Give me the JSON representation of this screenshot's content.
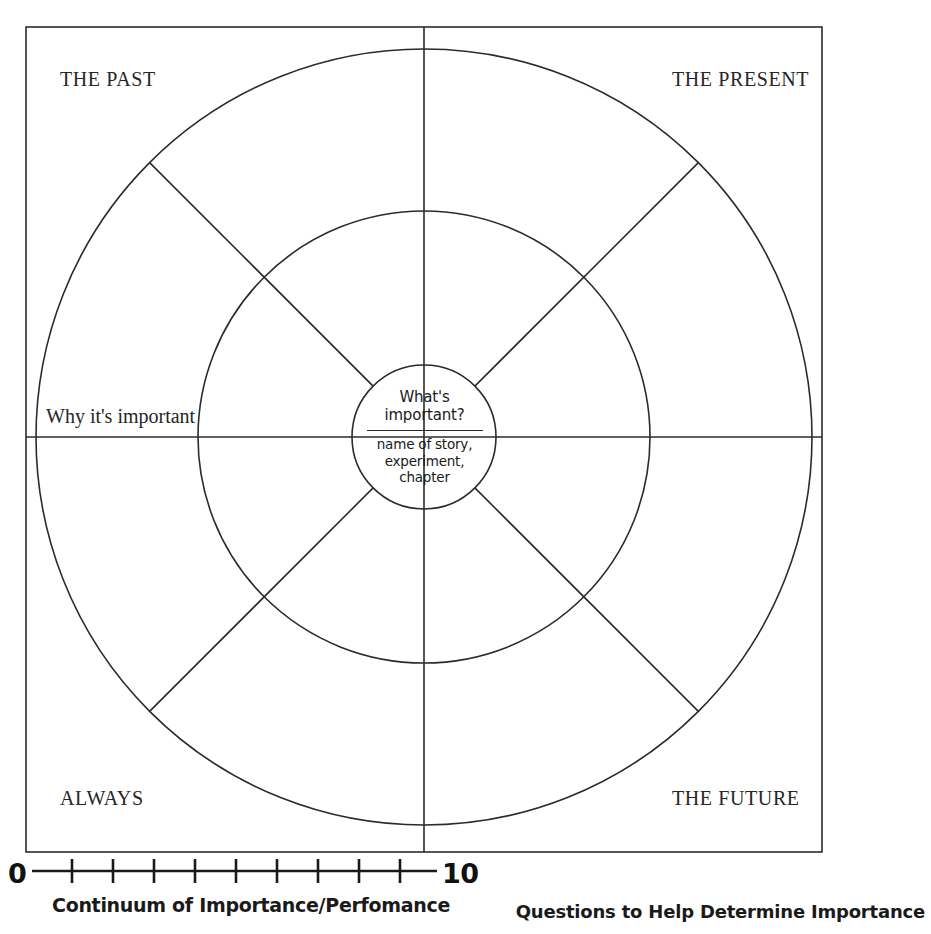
{
  "diagram": {
    "title_caption": "Questions to Help Determine Importance",
    "quadrants": [
      {
        "id": "past",
        "label": "THE PAST"
      },
      {
        "id": "present",
        "label": "THE PRESENT"
      },
      {
        "id": "always",
        "label": "ALWAYS"
      },
      {
        "id": "future",
        "label": "THE FUTURE"
      }
    ],
    "axis_labels": {
      "left": "Why it's important"
    },
    "center": {
      "prompt": "What's\nimportant?",
      "prompt_line1": "What's",
      "prompt_line2": "important?",
      "subject": "name of story,\nexperiment,\nchapter",
      "subject_line1": "name of story,",
      "subject_line2": "experiment,",
      "subject_line3": "chapter"
    },
    "scale": {
      "min_label": "0",
      "max_label": "10",
      "caption": "Continuum of Importance/Perfomance",
      "tick_count": 9
    },
    "colors": {
      "stroke": "#2b2b2b",
      "text": "#1a1a1a",
      "background": "#ffffff"
    },
    "geometry": {
      "center_x": 424,
      "center_y": 437,
      "outer_radius": 388,
      "middle_radius": 226,
      "inner_radius": 72,
      "frame_left": 26,
      "frame_top": 27,
      "frame_right": 822,
      "frame_bottom": 852
    }
  }
}
